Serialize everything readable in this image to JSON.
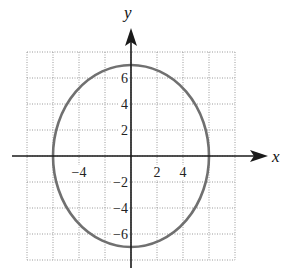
{
  "chart_data": {
    "type": "line",
    "title": "",
    "xlabel": "x",
    "ylabel": "y",
    "xlim": [
      -8,
      8
    ],
    "ylim": [
      -8,
      8
    ],
    "grid": true,
    "grid_style": "dotted",
    "grid_spacing": 2,
    "x_ticks": [
      -4,
      2,
      4
    ],
    "x_tick_labels": [
      "−4",
      "2",
      "4"
    ],
    "y_ticks": [
      6,
      4,
      2,
      -2,
      -4,
      -6
    ],
    "y_tick_labels": [
      "6",
      "4",
      "2",
      "−2",
      "−4",
      "−6"
    ],
    "series": [
      {
        "name": "ellipse",
        "equation": "x^2/36 + y^2/49 = 1",
        "center": [
          0,
          0
        ],
        "semi_axis_x": 6,
        "semi_axis_y": 7,
        "color": "#707070"
      }
    ],
    "legend": null
  },
  "labels": {
    "x_axis": "x",
    "y_axis": "y"
  },
  "colors": {
    "axis": "#1a1a1a",
    "grid": "#9a9a9a",
    "curve": "#707070"
  }
}
